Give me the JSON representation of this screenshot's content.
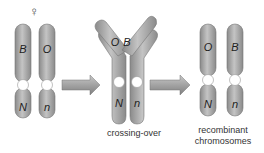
{
  "diagram": {
    "female_symbol": "♀",
    "stages": [
      {
        "name": "parental",
        "chromosomes": [
          {
            "upper_gene": "B",
            "lower_gene": "N"
          },
          {
            "upper_gene": "O",
            "lower_gene": "n"
          }
        ]
      },
      {
        "name": "crossing-over",
        "label": "crossing-over",
        "chromosomes": [
          {
            "upper_gene": "O",
            "lower_gene": "N"
          },
          {
            "upper_gene": "B",
            "lower_gene": "n"
          }
        ]
      },
      {
        "name": "recombinant",
        "label_line1": "recombinant",
        "label_line2": "chromosomes",
        "chromosomes": [
          {
            "upper_gene": "O",
            "lower_gene": "N"
          },
          {
            "upper_gene": "B",
            "lower_gene": "n"
          }
        ]
      }
    ],
    "colors": {
      "chromosome": "#a9a9a9",
      "chromosome_dark": "#7a7a7a",
      "arrow": "#8e8e8e",
      "centromere": "#ffffff"
    }
  }
}
